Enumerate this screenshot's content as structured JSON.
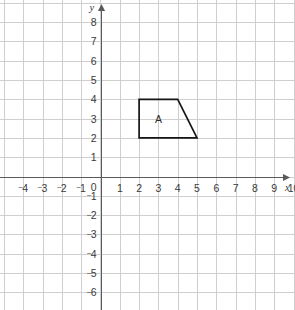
{
  "figure": {
    "title": "",
    "background_color": "#ffffff",
    "grid_color": "#cfcfcf",
    "axis_color": "#5a5a5a",
    "shape_stroke_color": "#151515"
  },
  "axes": {
    "x_axis_name": "x",
    "y_axis_name": "y",
    "origin_label": "0",
    "x_tick_labels": [
      "⁻4",
      "⁻3",
      "⁻2",
      "⁻1",
      "1",
      "2",
      "3",
      "4",
      "5",
      "6",
      "7",
      "8",
      "9",
      "10"
    ],
    "y_tick_labels": [
      "8",
      "7",
      "6",
      "5",
      "4",
      "3",
      "2",
      "1",
      "⁻1",
      "⁻2",
      "⁻3",
      "⁻4",
      "⁻5",
      "⁻6"
    ]
  },
  "chart_data": {
    "type": "scatter",
    "title": "",
    "xlabel": "x",
    "ylabel": "y",
    "xlim": [
      -5,
      10.4
    ],
    "ylim": [
      -6.8,
      8.7
    ],
    "x_ticks": [
      -4,
      -3,
      -2,
      -1,
      1,
      2,
      3,
      4,
      5,
      6,
      7,
      8,
      9,
      10
    ],
    "y_ticks": [
      8,
      7,
      6,
      5,
      4,
      3,
      2,
      1,
      -1,
      -2,
      -3,
      -4,
      -5,
      -6
    ],
    "grid": true,
    "grid_spacing": 1,
    "legend": null,
    "shapes": [
      {
        "label": "A",
        "type": "polygon",
        "vertices": [
          [
            2,
            4
          ],
          [
            4,
            4
          ],
          [
            5,
            2
          ],
          [
            2,
            2
          ]
        ],
        "label_position": [
          3,
          3
        ],
        "fill": "none",
        "stroke": "#151515"
      }
    ]
  }
}
